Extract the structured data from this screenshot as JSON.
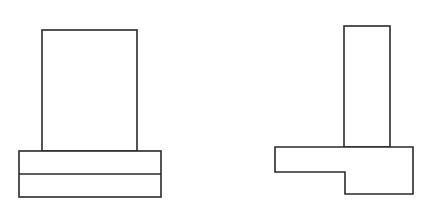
{
  "diagram": {
    "colors": {
      "background": "#ffffff",
      "line": "#2a2a2a"
    },
    "figures": [
      {
        "id": "left-figure",
        "label": "",
        "parts": {
          "column": {
            "x": 42,
            "y": 30,
            "width": 95,
            "height": 121
          },
          "base_slab": {
            "x": 19,
            "y": 151,
            "width": 142,
            "height": 46
          },
          "divider_y": 174
        }
      },
      {
        "id": "right-figure",
        "label": "",
        "parts": {
          "column": {
            "x": 344,
            "y": 26,
            "width": 46,
            "height": 121
          },
          "stepped_base_points": "275,147 413,147 413,194 345,194 345,172 275,172"
        }
      }
    ]
  }
}
